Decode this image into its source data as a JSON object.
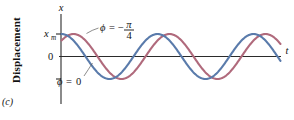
{
  "figure": {
    "panel_label": "(c)",
    "y_axis_title": "Displacement",
    "y_axis_symbol": "x",
    "x_axis_symbol": "t",
    "y_tick_labels": {
      "max": "x",
      "max_sub": "m",
      "zero": "0"
    },
    "annotations": [
      {
        "name": "phi-minus-pi-over-4",
        "phi_text": "ϕ",
        "equals": "=",
        "sign": "−",
        "numerator": "π",
        "denominator": "4",
        "curve": "red"
      },
      {
        "name": "phi-zero",
        "phi_text": "ϕ",
        "equals": "=",
        "value": "0",
        "curve": "blue"
      }
    ]
  },
  "colors": {
    "curve_blue": "#5a7bab",
    "curve_red": "#b06a7c",
    "axis": "#2b2b2b",
    "background": "#ffffff",
    "leader": "#5a5a5a"
  },
  "chart_data": {
    "type": "line",
    "title": "",
    "xlabel": "t",
    "ylabel": "Displacement",
    "grid": false,
    "legend": "annotated-inline",
    "xlim": [
      0,
      2.45
    ],
    "ylim": [
      -1.25,
      1.25
    ],
    "axis_ticks_y": [
      {
        "value": 1,
        "label": "x_m"
      },
      {
        "value": 0,
        "label": "0"
      },
      {
        "value": -1,
        "label": ""
      }
    ],
    "series": [
      {
        "name": "phi = 0",
        "color": "#5a7bab",
        "amplitude": 1,
        "phase_rad": 0,
        "phase_label": "ϕ = 0",
        "periods_shown": 2.2,
        "x": [
          0.0,
          0.125,
          0.25,
          0.375,
          0.5,
          0.625,
          0.75,
          0.875,
          1.0,
          1.125,
          1.25,
          1.375,
          1.5,
          1.625,
          1.75,
          1.875,
          2.0,
          2.125,
          2.25,
          2.375
        ],
        "y": [
          1.0,
          0.707,
          0.0,
          -0.707,
          -1.0,
          -0.707,
          0.0,
          0.707,
          1.0,
          0.707,
          0.0,
          -0.707,
          -1.0,
          -0.707,
          0.0,
          0.707,
          1.0,
          0.707,
          0.0,
          -0.707
        ]
      },
      {
        "name": "phi = -pi/4",
        "color": "#b06a7c",
        "amplitude": 1,
        "phase_rad": -0.7853981634,
        "phase_label": "ϕ = −π/4",
        "periods_shown": 2.2,
        "x": [
          0.0,
          0.125,
          0.25,
          0.375,
          0.5,
          0.625,
          0.75,
          0.875,
          1.0,
          1.125,
          1.25,
          1.375,
          1.5,
          1.625,
          1.75,
          1.875,
          2.0,
          2.125,
          2.25,
          2.375
        ],
        "y": [
          0.707,
          1.0,
          0.707,
          0.0,
          -0.707,
          -1.0,
          -0.707,
          0.0,
          0.707,
          1.0,
          0.707,
          0.0,
          -0.707,
          -1.0,
          -0.707,
          0.0,
          0.707,
          1.0,
          0.707,
          0.0
        ]
      }
    ]
  }
}
